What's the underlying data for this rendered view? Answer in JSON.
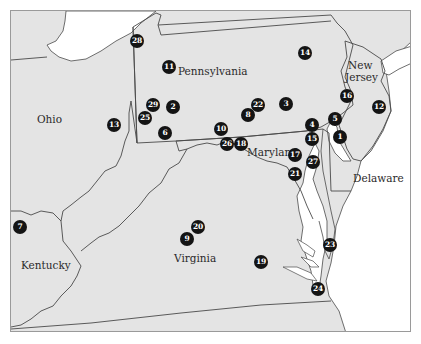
{
  "map": {
    "colors": {
      "land": "#e4e4e4",
      "water": "#ffffff",
      "border": "#4a4a4a",
      "marker_fill": "#141414",
      "marker_text": "#ffffff",
      "label_text": "#2a2a2a"
    },
    "state_labels": [
      {
        "name": "Pennsylvania",
        "x": 205,
        "y": 70
      },
      {
        "name": "Ohio",
        "x": 50,
        "y": 118
      },
      {
        "name": "New",
        "x": 360,
        "y": 63
      },
      {
        "name": "Jersey",
        "x": 360,
        "y": 75
      },
      {
        "name": "Maryland",
        "x": 262,
        "y": 150
      },
      {
        "name": "Delaware",
        "x": 374,
        "y": 177
      },
      {
        "name": "Kentucky",
        "x": 42,
        "y": 263
      },
      {
        "name": "Virginia",
        "x": 189,
        "y": 256
      }
    ],
    "markers": [
      {
        "id": "1",
        "x": 339,
        "y": 136
      },
      {
        "id": "2",
        "x": 172,
        "y": 106
      },
      {
        "id": "3",
        "x": 285,
        "y": 103
      },
      {
        "id": "4",
        "x": 311,
        "y": 124
      },
      {
        "id": "5",
        "x": 334,
        "y": 118
      },
      {
        "id": "6",
        "x": 164,
        "y": 132
      },
      {
        "id": "7",
        "x": 19,
        "y": 226
      },
      {
        "id": "8",
        "x": 247,
        "y": 114
      },
      {
        "id": "9",
        "x": 186,
        "y": 238
      },
      {
        "id": "10",
        "x": 220,
        "y": 128
      },
      {
        "id": "11",
        "x": 168,
        "y": 66
      },
      {
        "id": "12",
        "x": 378,
        "y": 106
      },
      {
        "id": "13",
        "x": 113,
        "y": 124
      },
      {
        "id": "14",
        "x": 304,
        "y": 52
      },
      {
        "id": "15",
        "x": 311,
        "y": 138
      },
      {
        "id": "16",
        "x": 346,
        "y": 95
      },
      {
        "id": "17",
        "x": 294,
        "y": 154
      },
      {
        "id": "18",
        "x": 240,
        "y": 143
      },
      {
        "id": "19",
        "x": 260,
        "y": 261
      },
      {
        "id": "20",
        "x": 197,
        "y": 226
      },
      {
        "id": "21",
        "x": 294,
        "y": 173
      },
      {
        "id": "22",
        "x": 257,
        "y": 104
      },
      {
        "id": "23",
        "x": 329,
        "y": 244
      },
      {
        "id": "24",
        "x": 317,
        "y": 288
      },
      {
        "id": "25",
        "x": 144,
        "y": 117
      },
      {
        "id": "26",
        "x": 226,
        "y": 143
      },
      {
        "id": "27",
        "x": 312,
        "y": 161
      },
      {
        "id": "28",
        "x": 136,
        "y": 40
      },
      {
        "id": "29",
        "x": 152,
        "y": 104
      }
    ]
  }
}
